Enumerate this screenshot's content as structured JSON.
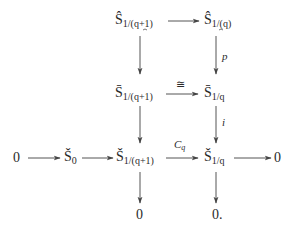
{
  "diagram": {
    "type": "commutative-diagram",
    "nodes": {
      "top_left": {
        "base": "Ŝ",
        "sub": "1/(q+1)"
      },
      "top_right": {
        "base": "Ŝ",
        "sub": "1/(q)"
      },
      "mid_left": {
        "base": "S̄",
        "sub": "1/(q+1)"
      },
      "mid_right": {
        "base": "S̄",
        "sub": "1/q"
      },
      "bot_zero_left": {
        "text": "0"
      },
      "bot_s0": {
        "base": "Š",
        "sub": "0"
      },
      "bot_left": {
        "base": "Š",
        "sub": "1/(q+1)"
      },
      "bot_right": {
        "base": "Š",
        "sub": "1/q"
      },
      "bot_zero_right": {
        "text": "0"
      },
      "low_zero_left": {
        "text": "0"
      },
      "low_zero_right": {
        "text": "0."
      }
    },
    "arrow_labels": {
      "top_right_down": "p",
      "mid_horizontal": "≅",
      "mid_right_down": "i",
      "bot_middle_base": "C",
      "bot_middle_sub": "q"
    },
    "edges": [
      {
        "from": "top_left",
        "to": "top_right",
        "label": ""
      },
      {
        "from": "top_left",
        "to": "mid_left",
        "label": ""
      },
      {
        "from": "top_right",
        "to": "mid_right",
        "label": "p"
      },
      {
        "from": "mid_left",
        "to": "mid_right",
        "label": "≅"
      },
      {
        "from": "mid_left",
        "to": "bot_left",
        "label": ""
      },
      {
        "from": "mid_right",
        "to": "bot_right",
        "label": "i"
      },
      {
        "from": "bot_zero_left",
        "to": "bot_s0",
        "label": ""
      },
      {
        "from": "bot_s0",
        "to": "bot_left",
        "label": ""
      },
      {
        "from": "bot_left",
        "to": "bot_right",
        "label": "C_q"
      },
      {
        "from": "bot_right",
        "to": "bot_zero_right",
        "label": ""
      },
      {
        "from": "bot_left",
        "to": "low_zero_left",
        "label": ""
      },
      {
        "from": "bot_right",
        "to": "low_zero_right",
        "label": ""
      }
    ]
  }
}
